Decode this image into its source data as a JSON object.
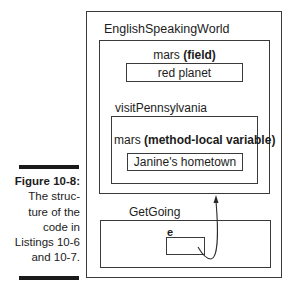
{
  "figure": {
    "number_label": "Figure 10-8:",
    "caption_lines": [
      "The struc-",
      "ture of the",
      "code in",
      "Listings 10-6",
      "and 10-7."
    ]
  },
  "diagram": {
    "outer_class": {
      "name": "EnglishSpeakingWorld",
      "field": {
        "name": "mars",
        "kind": "(field)",
        "value": "red planet"
      },
      "method": {
        "name": "visitPennsylvania",
        "local_variable": {
          "name": "mars",
          "kind": "(method-local variable)",
          "value": "Janine's hometown"
        }
      }
    },
    "other_class": {
      "name": "GetGoing",
      "variable": {
        "name": "e"
      }
    },
    "arrow": {
      "from": "e",
      "to": "EnglishSpeakingWorld"
    },
    "colors": {
      "line": "#3a3a3a",
      "text": "#1c1c1c"
    }
  }
}
